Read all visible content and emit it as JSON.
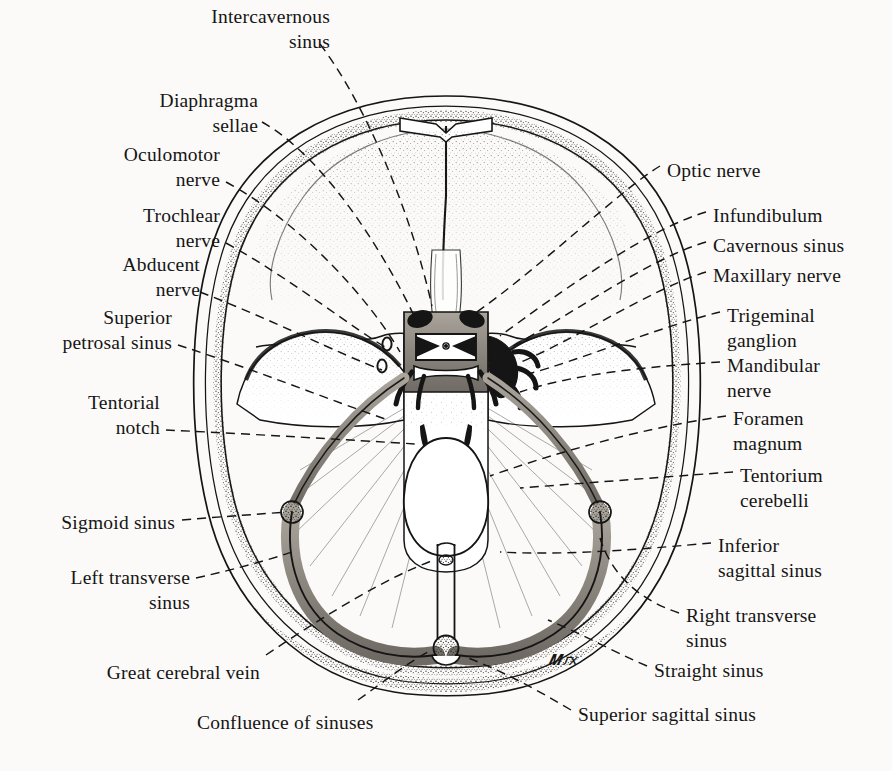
{
  "figure": {
    "background_color": "#fbfaf8",
    "ink_color": "#151515",
    "sinus_fill_color": "#8d8880",
    "artist_monogram": "MF"
  },
  "labels_left": [
    {
      "id": "intercavernous-sinus",
      "text": "Intercavernous\nsinus",
      "x": 170,
      "y": 4,
      "width": 160,
      "align": "right"
    },
    {
      "id": "diaphragma-sellae",
      "text": "Diaphragma\nsellae",
      "x": 118,
      "y": 88,
      "width": 140,
      "align": "right"
    },
    {
      "id": "oculomotor-nerve",
      "text": "Oculomotor\nnerve",
      "x": 88,
      "y": 142,
      "width": 132,
      "align": "right"
    },
    {
      "id": "trochlear-nerve",
      "text": "Trochlear\nnerve",
      "x": 96,
      "y": 203,
      "width": 124,
      "align": "right"
    },
    {
      "id": "abducent-nerve",
      "text": "Abducent\nnerve",
      "x": 76,
      "y": 252,
      "width": 124,
      "align": "right"
    },
    {
      "id": "superior-petrosal-sinus",
      "text": "Superior\npetrosal sinus",
      "x": 32,
      "y": 305,
      "width": 140,
      "align": "right"
    },
    {
      "id": "tentorial-notch",
      "text": "Tentorial\nnotch",
      "x": 40,
      "y": 390,
      "width": 120,
      "align": "right"
    },
    {
      "id": "sigmoid-sinus",
      "text": "Sigmoid sinus",
      "x": 35,
      "y": 510,
      "width": 140,
      "align": "right"
    },
    {
      "id": "left-transverse-sinus",
      "text": "Left transverse\nsinus",
      "x": 38,
      "y": 565,
      "width": 152,
      "align": "right"
    },
    {
      "id": "great-cerebral-vein",
      "text": "Great cerebral vein",
      "x": 70,
      "y": 660,
      "width": 190,
      "align": "right"
    }
  ],
  "labels_right": [
    {
      "id": "optic-nerve",
      "text": "Optic nerve",
      "x": 667,
      "y": 158,
      "width": 180,
      "align": "left"
    },
    {
      "id": "infundibulum",
      "text": "Infundibulum",
      "x": 713,
      "y": 203,
      "width": 180,
      "align": "left"
    },
    {
      "id": "cavernous-sinus",
      "text": "Cavernous sinus",
      "x": 713,
      "y": 233,
      "width": 180,
      "align": "left"
    },
    {
      "id": "maxillary-nerve",
      "text": "Maxillary nerve",
      "x": 713,
      "y": 263,
      "width": 180,
      "align": "left"
    },
    {
      "id": "trigeminal-ganglion",
      "text": "Trigeminal\nganglion",
      "x": 727,
      "y": 303,
      "width": 160,
      "align": "left"
    },
    {
      "id": "mandibular-nerve",
      "text": "Mandibular\nnerve",
      "x": 727,
      "y": 353,
      "width": 160,
      "align": "left"
    },
    {
      "id": "foramen-magnum",
      "text": "Foramen\nmagnum",
      "x": 733,
      "y": 406,
      "width": 160,
      "align": "left"
    },
    {
      "id": "tentorium-cerebelli",
      "text": "Tentorium\ncerebelli",
      "x": 740,
      "y": 463,
      "width": 160,
      "align": "left"
    },
    {
      "id": "inferior-sagittal-sinus",
      "text": "Inferior\nsagittal sinus",
      "x": 718,
      "y": 533,
      "width": 170,
      "align": "left"
    },
    {
      "id": "right-transverse-sinus",
      "text": "Right transverse\nsinus",
      "x": 686,
      "y": 603,
      "width": 180,
      "align": "left"
    },
    {
      "id": "straight-sinus",
      "text": "Straight sinus",
      "x": 654,
      "y": 658,
      "width": 170,
      "align": "left"
    },
    {
      "id": "superior-sagittal-sinus",
      "text": "Superior sagittal sinus",
      "x": 578,
      "y": 702,
      "width": 240,
      "align": "left"
    }
  ],
  "labels_bottom": [
    {
      "id": "confluence-of-sinuses",
      "text": "Confluence of sinuses",
      "x": 197,
      "y": 710,
      "width": 240,
      "align": "left"
    }
  ],
  "structures": [
    {
      "name": "superior-sagittal-sinus-structure",
      "kind": "venous-sinus"
    },
    {
      "name": "transverse-sinus-left",
      "kind": "venous-sinus"
    },
    {
      "name": "transverse-sinus-right",
      "kind": "venous-sinus"
    },
    {
      "name": "sigmoid-sinus-structure",
      "kind": "venous-sinus"
    },
    {
      "name": "straight-sinus-structure",
      "kind": "venous-sinus"
    },
    {
      "name": "confluence-of-sinuses-structure",
      "kind": "venous-sinus"
    },
    {
      "name": "cavernous-sinus-structure",
      "kind": "venous-sinus"
    },
    {
      "name": "superior-petrosal-sinus-structure",
      "kind": "venous-sinus"
    },
    {
      "name": "foramen-magnum-structure",
      "kind": "foramen"
    },
    {
      "name": "tentorium-cerebelli-structure",
      "kind": "dural-fold"
    },
    {
      "name": "anterior-cranial-fossa",
      "kind": "fossa"
    },
    {
      "name": "middle-cranial-fossa",
      "kind": "fossa"
    },
    {
      "name": "trigeminal-ganglion-structure",
      "kind": "ganglion"
    }
  ]
}
